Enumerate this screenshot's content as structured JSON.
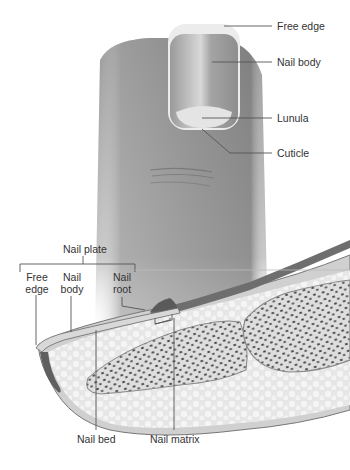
{
  "diagram": {
    "type": "anatomical-illustration",
    "colors": {
      "skin": "#8f8f8f",
      "skin_dark": "#6d6d6d",
      "nail": "#a9a9a9",
      "nail_highlight": "#d6d6d6",
      "lunula": "#e4e4e4",
      "fat": "#e9e9e9",
      "bone": "#dcdcdc",
      "bone_spongy": "#444444",
      "line": "#555555",
      "text": "#333333"
    },
    "top_view_labels": {
      "free_edge": "Free edge",
      "nail_body": "Nail body",
      "lunula": "Lunula",
      "cuticle": "Cuticle"
    },
    "section_labels": {
      "nail_plate": "Nail plate",
      "free_edge_l1": "Free",
      "free_edge_l2": "edge",
      "nail_body_l1": "Nail",
      "nail_body_l2": "body",
      "nail_root_l1": "Nail",
      "nail_root_l2": "root",
      "nail_bed": "Nail bed",
      "nail_matrix": "Nail matrix"
    }
  }
}
